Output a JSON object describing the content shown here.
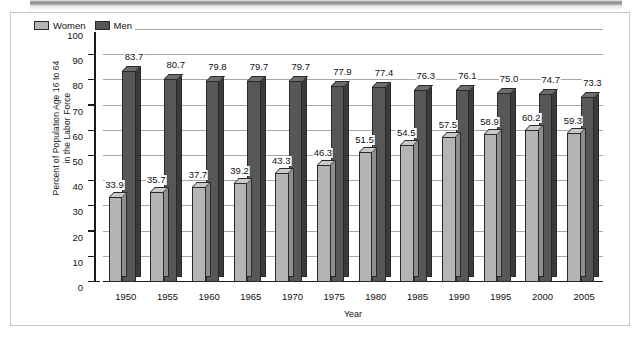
{
  "chart_data": {
    "type": "bar",
    "title": "",
    "xlabel": "Year",
    "ylabel": "Percent of Population Age 16 to 64 in the Labor Force",
    "ylabel_line1": "Percent of Population Age 16 to 64",
    "ylabel_line2": "in the Labor Force",
    "categories": [
      "1950",
      "1955",
      "1960",
      "1965",
      "1970",
      "1975",
      "1980",
      "1985",
      "1990",
      "1995",
      "2000",
      "2005"
    ],
    "series": [
      {
        "name": "Women",
        "color": "#b4b4b4",
        "values": [
          33.9,
          35.7,
          37.7,
          39.2,
          43.3,
          46.3,
          51.5,
          54.5,
          57.5,
          58.9,
          60.2,
          59.3
        ]
      },
      {
        "name": "Men",
        "color": "#575757",
        "values": [
          83.7,
          80.7,
          79.8,
          79.7,
          79.7,
          77.9,
          77.4,
          76.3,
          76.1,
          75.0,
          74.7,
          73.3
        ]
      }
    ],
    "value_labels": {
      "Women": [
        "33.9",
        "35.7",
        "37.7",
        "39.2",
        "43.3",
        "46.3",
        "51.5",
        "54.5",
        "57.5",
        "58.9",
        "60.2",
        "59.3"
      ],
      "Men": [
        "83.7",
        "80.7",
        "79.8",
        "79.7",
        "79.7",
        "77.9",
        "77.4",
        "76.3",
        "76.1",
        "75.0",
        "74.7",
        "73.3"
      ]
    },
    "ylim": [
      0,
      100
    ],
    "yticks": [
      0,
      10,
      20,
      30,
      40,
      50,
      60,
      70,
      80,
      90,
      100
    ],
    "ytick_labels": [
      "0",
      "10",
      "20",
      "30",
      "40",
      "50",
      "60",
      "70",
      "80",
      "90",
      "100"
    ],
    "grid": true,
    "legend_position": "top-left",
    "legend": [
      "Women",
      "Men"
    ]
  }
}
